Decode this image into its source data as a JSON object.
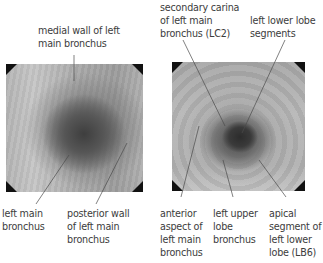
{
  "figure": {
    "left_panel": {
      "name": "bronchoscopic view of left main bronchus",
      "labels": {
        "top": "medial wall of left\nmain bronchus",
        "bottom_left": "left main\nbronchus",
        "bottom_right": "posterior wall\nof left main\nbronchus"
      }
    },
    "right_panel": {
      "name": "bronchoscopic view of secondary carina",
      "labels": {
        "top_left": "secondary carina\nof left main\nbronchus (LC2)",
        "top_right": "left lower lobe\nsegments",
        "bottom_left": "anterior\naspect of\nleft main\nbronchus",
        "bottom_middle": "left upper\nlobe\nbronchus",
        "bottom_right": "apical\nsegment of\nleft lower\nlobe (LB6)"
      }
    }
  },
  "colors": {
    "text": "#3c3c3c",
    "leader_line": "#4a4a4a",
    "corner_mask": "#111111"
  }
}
